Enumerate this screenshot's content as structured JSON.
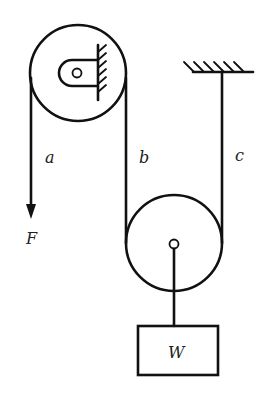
{
  "diagram": {
    "type": "pulley-system",
    "components": {
      "fixed_pulley": "Fixed pulley mounted to wall bracket",
      "movable_pulley": "Movable pulley supporting load",
      "ceiling_support": "Ceiling anchor",
      "load": "Block"
    },
    "labels": {
      "rope_a": "a",
      "rope_b": "b",
      "rope_c": "c",
      "force": "F",
      "weight": "W"
    },
    "colors": {
      "line": "#111111",
      "background": "#ffffff"
    }
  }
}
